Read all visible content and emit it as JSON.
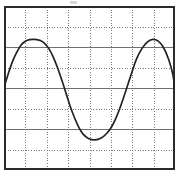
{
  "figure": {
    "kind": "oscilloscope-graticule",
    "title": "",
    "background_color": "#ffffff"
  },
  "graticule": {
    "columns": 8,
    "rows": 8,
    "grid_style": "dotted",
    "grid_color": "#7a7a7a",
    "border_color": "#2b2b2b",
    "border_visible": true,
    "plot_left_px": 4,
    "plot_top_px": 6,
    "plot_width_px": 171,
    "plot_height_px": 164
  },
  "trace": {
    "color": "#232323",
    "line_width_px": 1.7,
    "label": ""
  },
  "artifact": {
    "name": "scan-smudge",
    "color": "#b9b9b9"
  },
  "chart_data": {
    "type": "line",
    "title": "",
    "subtitle": "",
    "xlabel": "",
    "ylabel": "",
    "grid": true,
    "legend": "none",
    "legend_entries": [],
    "annotations": [],
    "x_divisions": 8,
    "y_divisions": 8,
    "xlim": [
      0,
      8
    ],
    "ylim": [
      0,
      8
    ],
    "x_tick_labels": [],
    "y_tick_labels": [],
    "waveform": {
      "shape": "sine",
      "cycles": 1.95,
      "amplitude_divisions": 2.45,
      "offset_divisions": 4.08,
      "period_divisions": 4.1,
      "phase_peak_x_divisions": 1.45,
      "peaks_x_divisions": [
        1.45,
        6.95
      ],
      "peak_y_divisions": 1.63,
      "trough_x_divisions": 4.25,
      "trough_y_divisions": 6.53,
      "entry_y_divisions": 3.95,
      "exit_y_divisions": 4.1
    },
    "series": [
      {
        "name": "trace",
        "x": [
          0.0,
          0.2,
          0.4,
          0.6,
          0.8,
          1.0,
          1.2,
          1.45,
          1.7,
          1.9,
          2.1,
          2.3,
          2.5,
          2.7,
          2.9,
          3.1,
          3.3,
          3.5,
          3.7,
          3.95,
          4.25,
          4.55,
          4.8,
          5.0,
          5.2,
          5.4,
          5.6,
          5.8,
          6.0,
          6.2,
          6.45,
          6.7,
          6.95,
          7.2,
          7.45,
          7.7,
          7.9,
          8.0
        ],
        "y": [
          3.95,
          3.3,
          2.7,
          2.25,
          1.9,
          1.72,
          1.64,
          1.63,
          1.68,
          1.82,
          2.08,
          2.48,
          3.0,
          3.6,
          4.25,
          4.9,
          5.45,
          5.92,
          6.25,
          6.46,
          6.53,
          6.44,
          6.22,
          5.95,
          5.55,
          5.05,
          4.45,
          3.82,
          3.18,
          2.58,
          2.08,
          1.76,
          1.63,
          1.7,
          2.0,
          2.6,
          3.35,
          4.1
        ]
      }
    ]
  }
}
